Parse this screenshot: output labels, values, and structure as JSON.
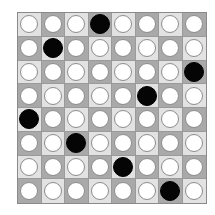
{
  "board": {
    "size": 8,
    "colors": {
      "light_square": "#e2e2e2",
      "dark_square": "#a9a9a9",
      "filled_piece": "#050505",
      "empty_piece": "#ffffff"
    },
    "filled_positions_by_row": [
      3,
      1,
      7,
      5,
      0,
      2,
      4,
      6
    ],
    "rows": [
      [
        "empty",
        "empty",
        "empty",
        "filled",
        "empty",
        "empty",
        "empty",
        "empty"
      ],
      [
        "empty",
        "filled",
        "empty",
        "empty",
        "empty",
        "empty",
        "empty",
        "empty"
      ],
      [
        "empty",
        "empty",
        "empty",
        "empty",
        "empty",
        "empty",
        "empty",
        "filled"
      ],
      [
        "empty",
        "empty",
        "empty",
        "empty",
        "empty",
        "filled",
        "empty",
        "empty"
      ],
      [
        "filled",
        "empty",
        "empty",
        "empty",
        "empty",
        "empty",
        "empty",
        "empty"
      ],
      [
        "empty",
        "empty",
        "filled",
        "empty",
        "empty",
        "empty",
        "empty",
        "empty"
      ],
      [
        "empty",
        "empty",
        "empty",
        "empty",
        "filled",
        "empty",
        "empty",
        "empty"
      ],
      [
        "empty",
        "empty",
        "empty",
        "empty",
        "empty",
        "empty",
        "filled",
        "empty"
      ]
    ]
  }
}
